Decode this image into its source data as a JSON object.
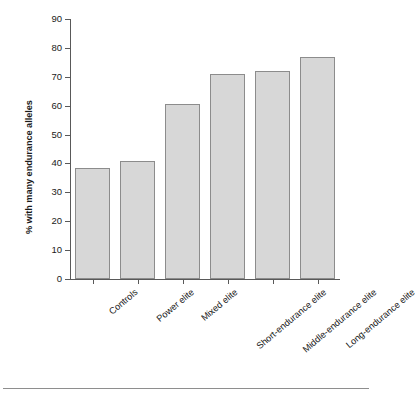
{
  "chart_data": {
    "type": "bar",
    "title": "",
    "xlabel": "",
    "ylabel": "% with many endurance alleles",
    "categories": [
      "Controls",
      "Power elite",
      "Mixed elite",
      "Short-endurance elite",
      "Middle-endurance elite",
      "Long-endurance elite"
    ],
    "values": [
      38.5,
      41,
      60.5,
      71,
      72,
      77
    ],
    "ylim": [
      0,
      90
    ],
    "yticks": [
      0,
      10,
      20,
      30,
      40,
      50,
      60,
      70,
      80,
      90
    ],
    "ytick_labels": [
      "0",
      "10",
      "20",
      "30",
      "40",
      "50",
      "60",
      "70",
      "80",
      "90"
    ],
    "grid": false,
    "legend": false,
    "bar_fill_color": "#d7d7d7",
    "bar_edge_color": "#8c8c8c",
    "axis_color": "#595959"
  }
}
